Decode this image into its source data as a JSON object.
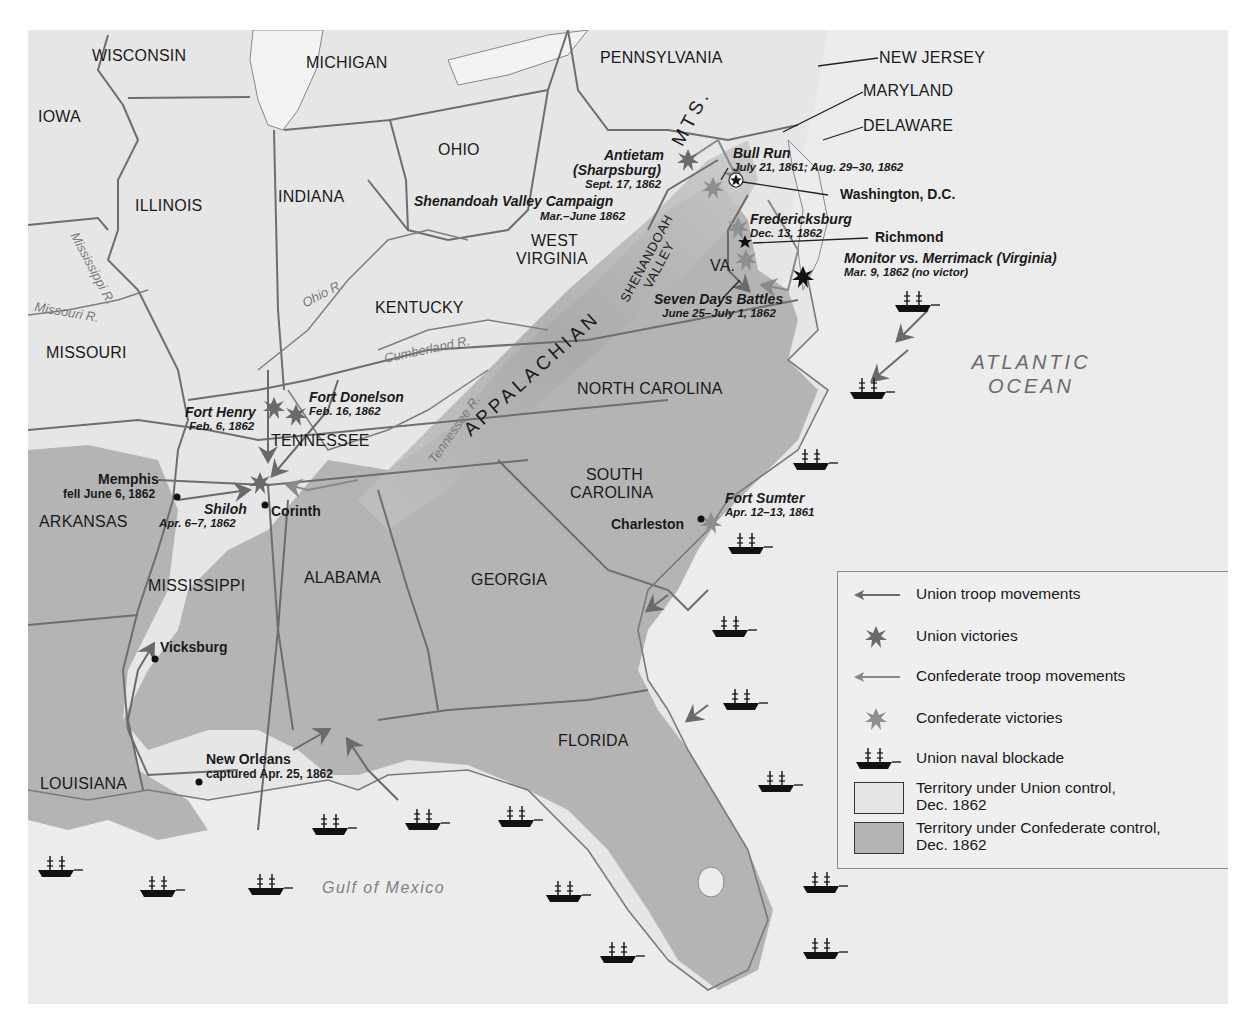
{
  "map": {
    "title": "Civil War, 1861-1862",
    "states": {
      "wisconsin": "WISCONSIN",
      "michigan": "MICHIGAN",
      "iowa": "IOWA",
      "illinois": "ILLINOIS",
      "indiana": "INDIANA",
      "ohio": "OHIO",
      "pennsylvania": "PENNSYLVANIA",
      "new_jersey": "NEW JERSEY",
      "maryland": "MARYLAND",
      "delaware": "DELAWARE",
      "west_virginia_1": "WEST",
      "west_virginia_2": "VIRGINIA",
      "virginia": "VA.",
      "missouri": "MISSOURI",
      "kentucky": "KENTUCKY",
      "tennessee": "TENNESSEE",
      "north_carolina": "NORTH CAROLINA",
      "south_carolina_1": "SOUTH",
      "south_carolina_2": "CAROLINA",
      "arkansas": "ARKANSAS",
      "mississippi": "MISSISSIPPI",
      "alabama": "ALABAMA",
      "georgia": "GEORGIA",
      "florida": "FLORIDA",
      "louisiana": "LOUISIANA"
    },
    "rivers": {
      "mississippi": "Mississippi R.",
      "missouri": "Missouri R.",
      "ohio": "Ohio R.",
      "cumberland": "Cumberland R.",
      "tennessee": "Tennessee R."
    },
    "physical": {
      "appalachian": "APPALACHIAN",
      "mts": "MTS.",
      "shenandoah_1": "SHENANDOAH",
      "shenandoah_2": "VALLEY",
      "atlantic_1": "ATLANTIC",
      "atlantic_2": "OCEAN",
      "gulf": "Gulf of Mexico"
    },
    "cities": {
      "washington": "Washington, D.C.",
      "richmond": "Richmond",
      "corinth": "Corinth",
      "vicksburg": "Vicksburg",
      "charleston": "Charleston",
      "memphis": "Memphis",
      "memphis_note": "fell June 6, 1862",
      "new_orleans": "New Orleans",
      "new_orleans_note": "captured Apr. 25, 1862"
    },
    "battles": {
      "antietam": {
        "name_1": "Antietam",
        "name_2": "(Sharpsburg)",
        "date": "Sept. 17, 1862"
      },
      "bull_run": {
        "name": "Bull Run",
        "date": "July 21, 1861; Aug. 29–30, 1862"
      },
      "shenandoah": {
        "name": "Shenandoah Valley Campaign",
        "date": "Mar.–June 1862"
      },
      "fredericksburg": {
        "name": "Fredericksburg",
        "date": "Dec. 13, 1862"
      },
      "monitor": {
        "name": "Monitor vs. Merrimack (Virginia)",
        "date": "Mar. 9, 1862 (no victor)"
      },
      "seven_days": {
        "name": "Seven Days Battles",
        "date": "June 25–July 1, 1862"
      },
      "fort_donelson": {
        "name": "Fort Donelson",
        "date": "Feb. 16, 1862"
      },
      "fort_henry": {
        "name": "Fort Henry",
        "date": "Feb. 6, 1862"
      },
      "shiloh": {
        "name": "Shiloh",
        "date": "Apr. 6–7, 1862"
      },
      "fort_sumter": {
        "name": "Fort Sumter",
        "date": "Apr. 12–13, 1861"
      }
    },
    "legend": {
      "union_troops": "Union troop movements",
      "union_victories": "Union victories",
      "confed_troops": "Confederate troop movements",
      "confed_victories": "Confederate victories",
      "blockade": "Union naval blockade",
      "union_territory_1": "Territory under Union control,",
      "union_territory_2": "Dec. 1862",
      "confed_territory_1": "Territory under Confederate control,",
      "confed_territory_2": "Dec. 1862"
    },
    "colors": {
      "union_territory": "#e6e6e6",
      "confederate_territory": "#b4b4b4",
      "ocean": "#ececec",
      "border": "#6e6e6e",
      "union_arrow": "#6a6a6a",
      "confederate_arrow": "#8a8a8a",
      "union_victory": "#6a6a6a",
      "confederate_victory": "#8e8e8e",
      "ship": "#111111"
    }
  }
}
